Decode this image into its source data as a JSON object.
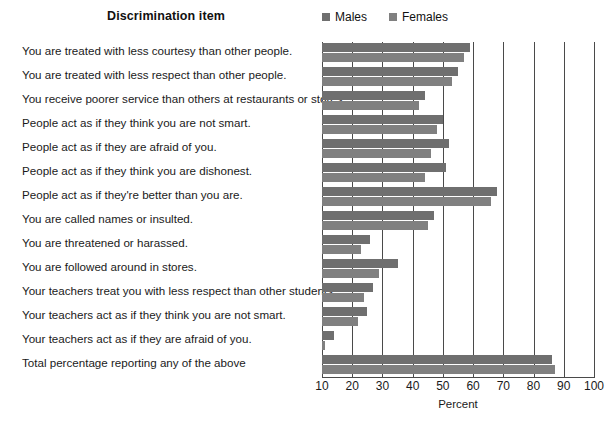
{
  "header": {
    "column_title": "Discrimination item"
  },
  "legend": {
    "position": "top-right",
    "entries": [
      {
        "label": "Males",
        "color": "#6f6f6f"
      },
      {
        "label": "Females",
        "color": "#808080"
      }
    ]
  },
  "chart_data": {
    "type": "bar",
    "orientation": "horizontal",
    "title": "Discrimination item",
    "xlabel": "Percent",
    "ylabel": "",
    "xlim": [
      10,
      100
    ],
    "xticks": [
      10,
      20,
      30,
      40,
      50,
      60,
      70,
      80,
      90,
      100
    ],
    "grid": true,
    "legend_position": "top-right",
    "categories": [
      "You are treated with less courtesy than other people.",
      "You are treated with less respect than other people.",
      "You receive poorer service than others at restaurants or stores.",
      "People act as if they think you are not smart.",
      "People act as if they are afraid of you.",
      "People act as if they think you are dishonest.",
      "People act as if they're better than you are.",
      "You are called names or insulted.",
      "You are threatened or harassed.",
      "You are followed around in stores.",
      "Your teachers treat you with less respect than other students.",
      "Your teachers act as if they think you are not smart.",
      "Your teachers act as if they are afraid of you.",
      "Total percentage reporting any of the above"
    ],
    "series": [
      {
        "name": "Males",
        "color": "#6f6f6f",
        "values": [
          59,
          55,
          44,
          50,
          52,
          51,
          68,
          47,
          26,
          35,
          27,
          25,
          14,
          86
        ]
      },
      {
        "name": "Females",
        "color": "#808080",
        "values": [
          57,
          53,
          42,
          48,
          46,
          44,
          66,
          45,
          23,
          29,
          24,
          22,
          11,
          87
        ]
      }
    ]
  }
}
